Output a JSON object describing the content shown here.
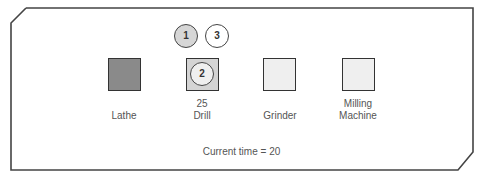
{
  "machines": [
    {
      "name": "Lathe",
      "queue_count": "",
      "state": "busy",
      "fill": "#8a8a8a"
    },
    {
      "name": "Drill",
      "queue_count": "25",
      "state": "processing",
      "fill": "#d4d4d4",
      "job_in_process": "2"
    },
    {
      "name": "Grinder",
      "queue_count": "",
      "state": "idle",
      "fill": "#efefef"
    },
    {
      "name": "Milling Machine",
      "line1": "Milling",
      "line2": "Machine",
      "queue_count": "",
      "state": "idle",
      "fill": "#efefef"
    }
  ],
  "waiting_jobs": [
    {
      "id": "1",
      "fill": "#d6d6d6"
    },
    {
      "id": "3",
      "fill": "#ffffff"
    }
  ],
  "status": {
    "text": "Current time = 20"
  }
}
